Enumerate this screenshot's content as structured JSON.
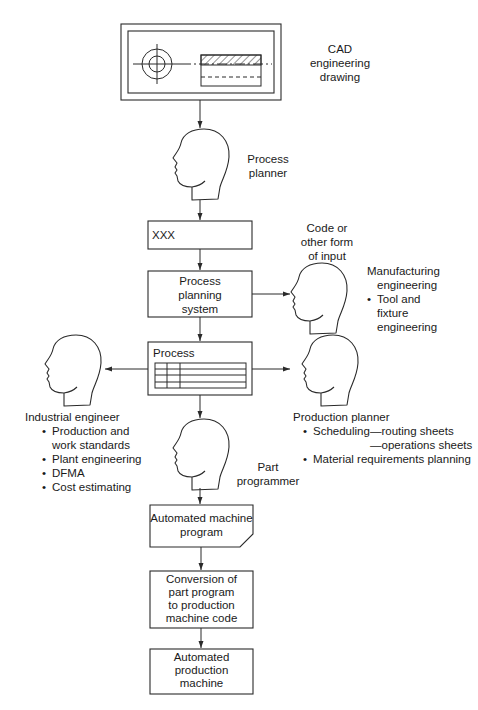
{
  "cad": {
    "label_line1": "CAD",
    "label_line2": "engineering",
    "label_line3": "drawing"
  },
  "process_planner": {
    "line1": "Process",
    "line2": "planner"
  },
  "xxx_box": {
    "text": "XXX"
  },
  "code_input": {
    "line1": "Code or",
    "line2": "other form",
    "line3": "of input"
  },
  "planning_system": {
    "line1": "Process",
    "line2": "planning",
    "line3": "system"
  },
  "manufacturing": {
    "title_line1": "Manufacturing",
    "title_line2": "engineering",
    "bullets": [
      "Tool and",
      "fixture",
      "engineering"
    ]
  },
  "process_box": {
    "title": "Process"
  },
  "industrial_engineer": {
    "title": "Industrial engineer",
    "bullets": [
      "Production and",
      "work standards",
      "Plant engineering",
      "DFMA",
      "Cost estimating"
    ]
  },
  "production_planner": {
    "title": "Production planner",
    "scheduling": "Scheduling—routing sheets",
    "operations": "—operations sheets",
    "mrp": "Material requirements planning"
  },
  "part_programmer": {
    "line1": "Part",
    "line2": "programmer"
  },
  "machine_program": {
    "line1": "Automated machine",
    "line2": "program"
  },
  "conversion": {
    "line1": "Conversion of",
    "line2": "part program",
    "line3": "to production",
    "line4": "machine code"
  },
  "production_machine": {
    "line1": "Automated",
    "line2": "production",
    "line3": "machine"
  },
  "colors": {
    "stroke": "#2a2a2a",
    "background": "#ffffff"
  }
}
